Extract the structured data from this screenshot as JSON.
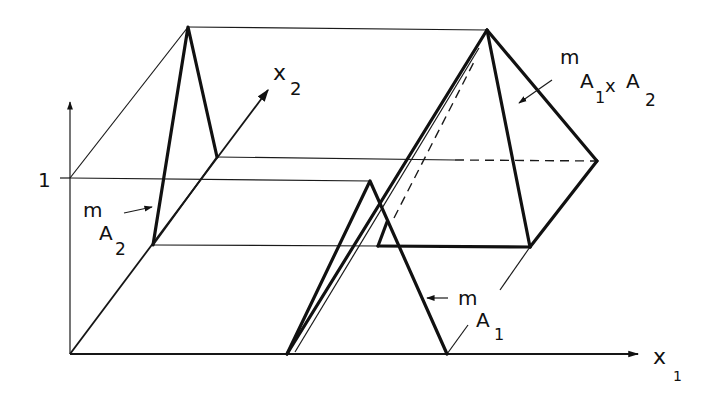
{
  "figure": {
    "axis_x1_label": "x",
    "axis_x1_sub": "1",
    "axis_x2_label": "x",
    "axis_x2_sub": "2",
    "tick_one": "1",
    "label_mA2": {
      "m": "m",
      "A": "A",
      "sub": "2"
    },
    "label_mA1": {
      "m": "m",
      "A": "A",
      "sub": "1"
    },
    "label_mA1xA2": {
      "m": "m",
      "A1": "A",
      "sub1": "1",
      "x": "x",
      "A2": "A",
      "sub2": "2"
    }
  },
  "colors": {
    "ink": "#111111",
    "background": "#ffffff"
  }
}
